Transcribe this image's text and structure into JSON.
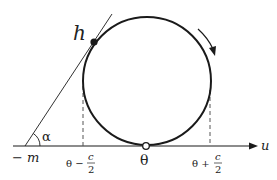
{
  "diagram": {
    "labels": {
      "point_h": "h",
      "angle": "α",
      "neg_m": "− m",
      "theta": "θ",
      "left_tick_prefix": "θ −",
      "right_tick_prefix": "θ +",
      "frac_num": "c",
      "frac_den": "2",
      "axis_u": "u"
    },
    "colors": {
      "stroke": "#1a1a1a",
      "dashed": "#555555",
      "background": "#ffffff"
    },
    "geometry": {
      "circle_center": [
        147,
        81
      ],
      "circle_radius": 64,
      "axis_y": 146,
      "axis_x_start": 13,
      "axis_x_end": 258,
      "tangent_start": [
        25,
        146
      ],
      "tangent_end": [
        112,
        14
      ],
      "h_point": [
        94,
        42
      ],
      "theta_point": [
        146,
        146
      ],
      "dashed_left_x": 83,
      "dashed_right_x": 210
    },
    "rotation_direction": "clockwise"
  }
}
